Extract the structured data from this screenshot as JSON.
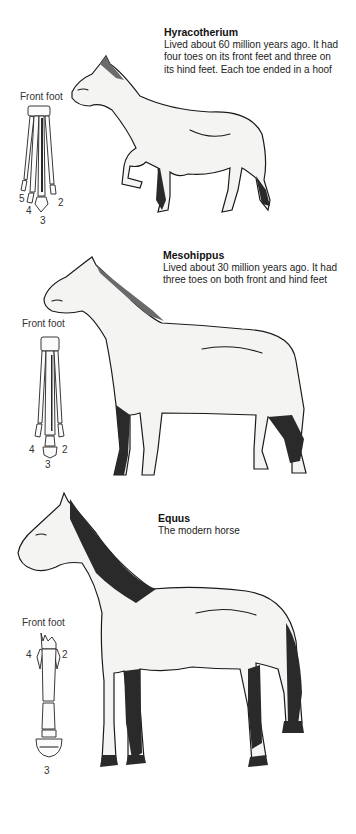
{
  "panels": [
    {
      "id": "hyracotherium",
      "name": "Hyracotherium",
      "description": "Lived about 60 million years ago. It had\nfour toes on its front feet and three on\nits hind feet.  Each toe ended in a hoof",
      "foot_label": "Front foot",
      "toe_numbers": [
        "5",
        "4",
        "3",
        "2"
      ]
    },
    {
      "id": "mesohippus",
      "name": "Mesohippus",
      "description": "Lived about 30 million years ago. It had\nthree toes on both front and hind feet",
      "foot_label": "Front foot",
      "toe_numbers": [
        "4",
        "3",
        "2"
      ]
    },
    {
      "id": "equus",
      "name": "Equus",
      "description": "The modern horse",
      "foot_label": "Front foot",
      "toe_numbers": [
        "4",
        "2",
        "3"
      ]
    }
  ]
}
